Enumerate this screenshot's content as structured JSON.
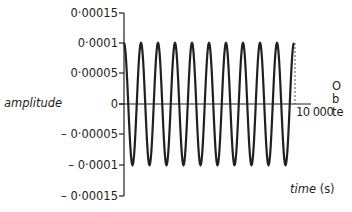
{
  "chart_data": {
    "type": "line",
    "title": "",
    "xlabel": "time (s)",
    "ylabel": "amplitude",
    "x_tick_labels": [
      "10 000"
    ],
    "y_tick_labels": [
      "0·00015",
      "0·0001",
      "0·00005",
      "0",
      "– 0·00005",
      "– 0·0001",
      "– 0·00015"
    ],
    "y_ticks": [
      0.00015,
      0.0001,
      5e-05,
      0,
      -5e-05,
      -0.0001,
      -0.00015
    ],
    "ylim": [
      -0.00015,
      0.00015
    ],
    "xlim": [
      0,
      10000
    ],
    "grid": false,
    "legend": null,
    "series": [
      {
        "name": "wave",
        "function": "cosine",
        "amplitude": 0.0001,
        "period_s": 1000,
        "cycles": 10,
        "x": [
          0,
          500,
          1000,
          1500,
          2000,
          2500,
          3000,
          3500,
          4000,
          4500,
          5000,
          5500,
          6000,
          6500,
          7000,
          7500,
          8000,
          8500,
          9000,
          9500,
          10000
        ],
        "values": [
          0.0001,
          -0.0001,
          0.0001,
          -0.0001,
          0.0001,
          -0.0001,
          0.0001,
          -0.0001,
          0.0001,
          -0.0001,
          0.0001,
          -0.0001,
          0.0001,
          -0.0001,
          0.0001,
          -0.0001,
          0.0001,
          -0.0001,
          0.0001,
          -0.0001,
          0.0001
        ]
      }
    ],
    "annotations": [
      {
        "type": "dashed-vertical-line",
        "x": 10000,
        "from_y": 0,
        "to_y": 0.0001
      }
    ]
  },
  "labels": {
    "ylabel": "amplitude",
    "xlabel_italic": "time",
    "xlabel_unit": " (s)",
    "xtick_end": "10 000",
    "yticks": [
      "0·00015",
      "0·0001",
      "0·00005",
      "0",
      "– 0·00005",
      "– 0·0001",
      "– 0·00015"
    ]
  },
  "cut_off_text": [
    "O",
    "b",
    "te"
  ]
}
